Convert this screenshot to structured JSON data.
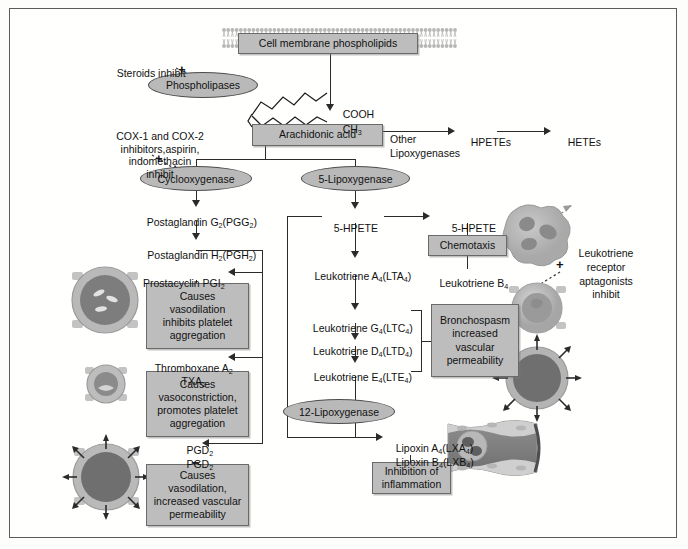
{
  "diagram": {
    "colors": {
      "box_fill": "#bdbdbd",
      "box_border": "#6a6a6a",
      "ellipse_fill": "#b9b9b9",
      "ellipse_border": "#4d4d4d",
      "line": "#2b2b2b",
      "frame": "#5b5b5b",
      "background": "#ffffff"
    }
  },
  "nodes": {
    "membrane": "Cell membrane phospholipids",
    "phospholipases": "Phospholipases",
    "arachidonic": "Arachidonic acid",
    "cyclooxygenase": "Cyclooxygenase",
    "lipoxygenase5": "5-Lipoxygenase",
    "lipoxygenase12": "12-Lipoxygenase",
    "chemotaxis": "Chemotaxis",
    "bronchospasm": "Bronchospasm\nincreased\nvascular\npermeability",
    "inhibition": "Inhibition of\ninflammation",
    "pgi2_effect": "Causes\nvasodilation\ninhibits platelet\naggregation",
    "txa2_effect": "Causes\nvasoconstriction,\npromotes platelet\naggregation",
    "pgd2_effect": "Causes\nvasodilation,\nincreased vascular\npermeability"
  },
  "chem_labels": {
    "cooh": "COOH",
    "ch3_base": "CH",
    "ch3_sub": "3",
    "other_lipoxygenases": "Other\nLipoxygenases",
    "hpetes": "HPETEs",
    "hetes": "HETEs",
    "pgg2_base": "Postaglandin G",
    "pgg2_sub": "2",
    "pgg2_paren": "(PGG",
    "pgg2_paren_sub": "2",
    "pgg2_close": ")",
    "pgh2_base": "Postaglandin H",
    "pgh2_sub": "2",
    "pgh2_paren": "(PGH",
    "pgh2_paren_sub": "2",
    "pgh2_close": ")",
    "hpete5_left": "5-HPETE",
    "hpete5_right": "5-HPETE",
    "lta4": "Leukotriene A",
    "lta4_sub": "4",
    "lta4_paren": "(LTA",
    "lta4_paren_sub": "4",
    "lta4_close": ")",
    "ltb4": "Leukotriene B",
    "ltb4_sub": "4",
    "ltc4": "Leukotriene G",
    "ltc4_sub": "4",
    "ltc4_paren": "(LTC",
    "ltc4_paren_sub": "4",
    "ltc4_close": ")",
    "ltd4": "Leukotriene D",
    "ltd4_sub": "4",
    "ltd4_paren": "(LTD",
    "ltd4_paren_sub": "4",
    "ltd4_close": ")",
    "lte4": "Leukotriene E",
    "lte4_sub": "4",
    "lte4_paren": "(LTE",
    "lte4_paren_sub": "4",
    "lte4_close": ")",
    "prostacyclin": "Prostacyclin PGI",
    "prostacyclin_sub": "2",
    "thromboxane": "Thromboxane A",
    "thromboxane_sub": "2",
    "txa2": "TXA",
    "txa2_sub": "2",
    "pgd2_a": "PGD",
    "pgd2_a_sub": "2",
    "pgd2_b": "PGD",
    "pgd2_b_sub": "2",
    "lxa4": "Lipoxin A",
    "lxa4_sub": "4",
    "lxa4_paren": "(LXA",
    "lxa4_paren_sub": "4",
    "lxa4_close": ")",
    "lxb4": "Lipoxin B",
    "lxb4_sub": "4",
    "lxb4_paren": "(LXB",
    "lxb4_paren_sub": "4",
    "lxb4_close": ")"
  },
  "annotations": {
    "steroids": "Steroids inhibit",
    "cox_inhibitors": "COX-1 and COX-2\ninhibitors,aspirin,\nindomethacin\ninhibit",
    "leukotriene_antagonists": "Leukotriene\nreceptor\naptagonists\ninhibit",
    "plus_symbol": "+"
  },
  "figures": {
    "neutrophil": "neutrophil-cell",
    "vessel_constricted_upper": "blood-vessel-cross-section",
    "vessel_dilated_arrows": "blood-vessel-dilated-arrows",
    "vessel_dilated_left": "blood-vessel-dilated",
    "vessel_constricted_left": "blood-vessel-constricted",
    "vessel_permeable_left": "blood-vessel-permeable",
    "vessel_longitudinal": "blood-vessel-longitudinal"
  }
}
